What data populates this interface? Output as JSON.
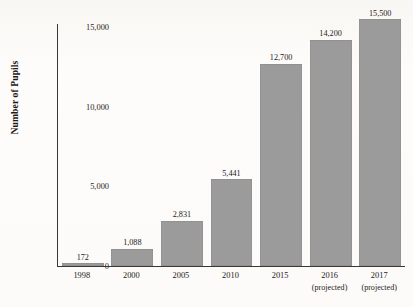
{
  "chart_data": {
    "type": "bar",
    "title": "Number of Charter Schools, Total Enrollment",
    "xlabel": "",
    "ylabel": "Number of Pupils",
    "ylim": [
      0,
      16500
    ],
    "grid": false,
    "legend": null,
    "categories": [
      "1998",
      "2000",
      "2005",
      "2010",
      "2015",
      "2016",
      "2017"
    ],
    "category_notes": [
      "",
      "",
      "",
      "",
      "",
      "(projected)",
      "(projected)"
    ],
    "values": [
      172,
      1088,
      2831,
      5441,
      12700,
      14200,
      15500
    ],
    "value_labels": [
      "172",
      "1,088",
      "2,831",
      "5,441",
      "12,700",
      "14,200",
      "15,500"
    ],
    "y_ticks": [
      0,
      5000,
      10000,
      15000
    ],
    "y_tick_labels": [
      "0",
      "5,000",
      "10,000",
      "15,000"
    ],
    "bar_color": "#9b9b9b",
    "axis_color": "#3a3734",
    "background_color": "#fdfcfa"
  }
}
